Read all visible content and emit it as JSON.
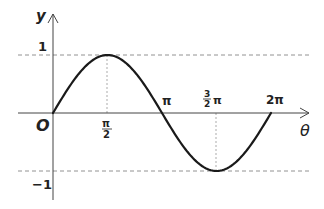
{
  "chart_data": {
    "type": "line",
    "title": "",
    "xlabel": "θ",
    "ylabel": "y",
    "function": "y = sin θ",
    "x": [
      0,
      0.7854,
      1.5708,
      2.3562,
      3.1416,
      3.927,
      4.7124,
      5.4978,
      6.2832
    ],
    "y": [
      0,
      0.7071,
      1,
      0.7071,
      0,
      -0.7071,
      -1,
      -0.7071,
      0
    ],
    "x_tick_labels": [
      "π/2",
      "π",
      "3/2 π",
      "2π"
    ],
    "x_tick_values": [
      1.5708,
      3.1416,
      4.7124,
      6.2832
    ],
    "y_tick_labels": [
      "1",
      "-1"
    ],
    "y_tick_values": [
      1,
      -1
    ],
    "origin_label": "O",
    "xlim": [
      0,
      6.2832
    ],
    "ylim": [
      -1,
      1
    ],
    "grid": false,
    "reference_lines": [
      {
        "type": "horizontal",
        "y": 1,
        "style": "dashed"
      },
      {
        "type": "horizontal",
        "y": -1,
        "style": "dashed"
      },
      {
        "type": "vertical",
        "x": 1.5708,
        "from": 0,
        "to": 1,
        "style": "dashed"
      },
      {
        "type": "vertical",
        "x": 4.7124,
        "from": -1,
        "to": 0,
        "style": "dashed"
      }
    ],
    "legend": null
  },
  "labels": {
    "y_axis": "y",
    "x_axis": "θ",
    "origin": "O",
    "y_pos_one": "1",
    "y_neg_one": "−1",
    "pi_half_num": "π",
    "pi_half_den": "2",
    "pi": "π",
    "three_half_num": "3",
    "three_half_den": "2",
    "three_half_pi": "π",
    "two_pi": "2π"
  }
}
